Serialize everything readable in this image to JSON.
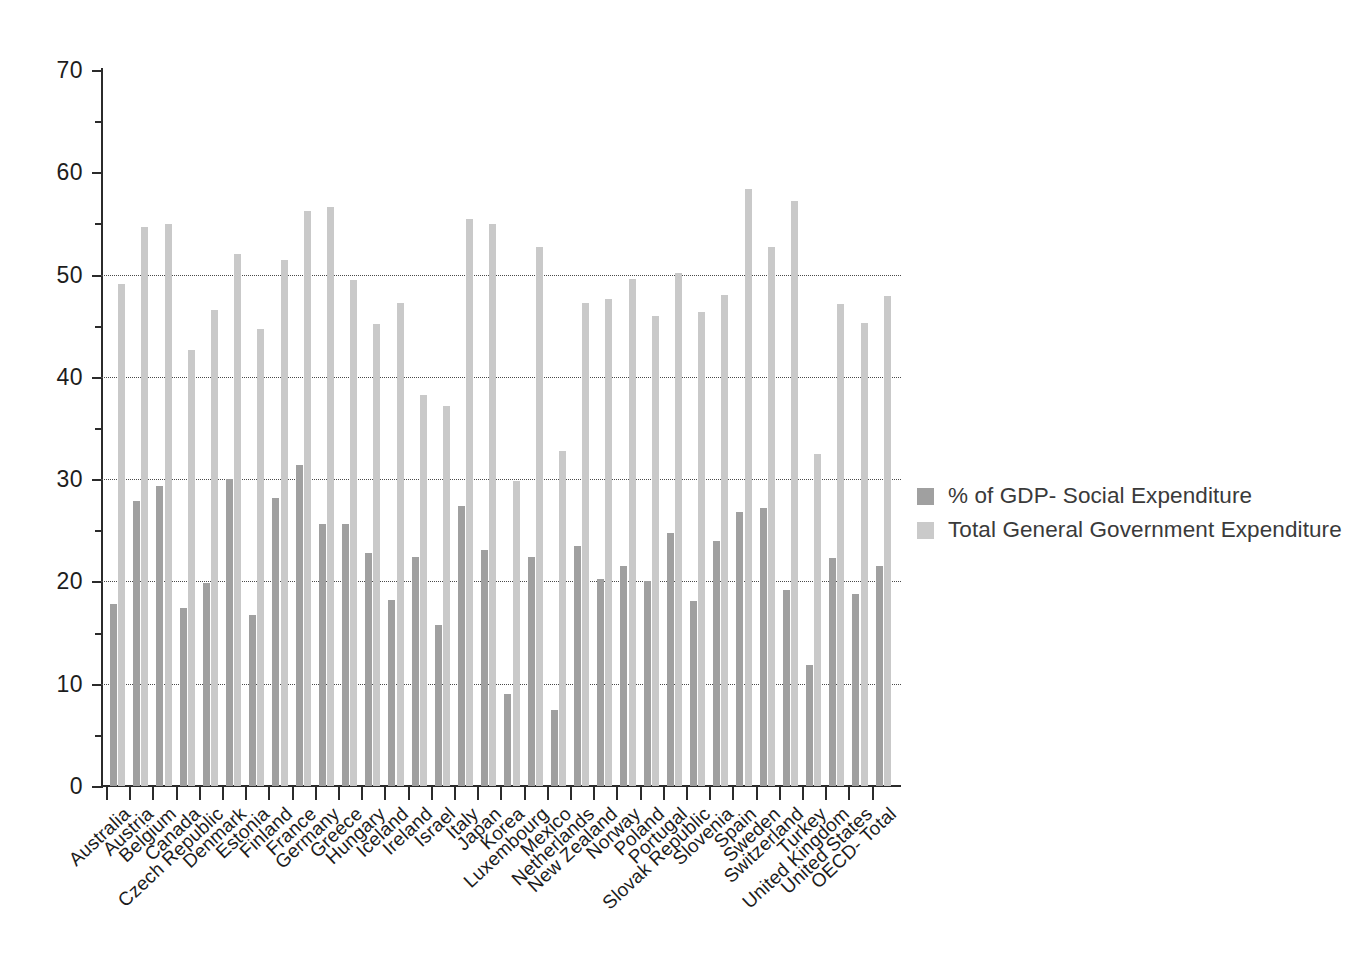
{
  "chart_data": {
    "type": "bar",
    "title": "",
    "subtitle": "",
    "xlabel": "",
    "ylabel": "",
    "ylim": [
      0,
      70
    ],
    "y_ticks": [
      0,
      10,
      20,
      30,
      40,
      50,
      60,
      70
    ],
    "y_tick_labels": [
      "0",
      "10",
      "20",
      "30",
      "40",
      "50",
      "60",
      "70"
    ],
    "y_minor_ticks": [
      5,
      15,
      25,
      35,
      45,
      55,
      65
    ],
    "grid": "horizontal-dotted-at-10-20-30-40-50",
    "grid_values": [
      10,
      20,
      30,
      40,
      50
    ],
    "legend_position": "right",
    "categories": [
      "Australia",
      "Austria",
      "Belgium",
      "Canada",
      "Czech Republic",
      "Denmark",
      "Estonia",
      "Finland",
      "France",
      "Germany",
      "Greece",
      "Hungary",
      "Iceland",
      "Ireland",
      "Israel",
      "Italy",
      "Japan",
      "Korea",
      "Luxembourg",
      "Mexico",
      "Netherlands",
      "New Zealand",
      "Norway",
      "Poland",
      "Portugal",
      "Slovak Republic",
      "Slovenia",
      "Spain",
      "Sweden",
      "Switzerland",
      "Turkey",
      "United Kingdom",
      "United States",
      "OECD- Total"
    ],
    "series": [
      {
        "name": "% of GDP- Social Expenditure",
        "color": "#a0a0a0",
        "values": [
          17.8,
          27.9,
          29.3,
          17.4,
          19.8,
          30.0,
          16.7,
          28.2,
          31.4,
          25.6,
          25.6,
          22.8,
          18.2,
          22.4,
          15.7,
          27.4,
          23.1,
          9.0,
          22.4,
          7.4,
          23.5,
          20.2,
          21.5,
          20.0,
          24.7,
          18.1,
          24.0,
          26.8,
          27.2,
          19.2,
          11.8,
          22.3,
          18.8,
          21.5
        ]
      },
      {
        "name": "Total General Government Expenditure",
        "color": "#c9c9c9",
        "values": [
          49.1,
          54.7,
          54.9,
          42.6,
          46.5,
          52.0,
          44.7,
          51.4,
          56.2,
          56.6,
          49.5,
          45.2,
          47.2,
          38.2,
          37.2,
          55.4,
          54.9,
          29.8,
          52.7,
          32.8,
          47.2,
          47.6,
          49.6,
          46.0,
          50.2,
          46.3,
          48.0,
          58.4,
          52.7,
          57.2,
          32.5,
          47.1,
          45.3,
          47.9
        ]
      }
    ]
  },
  "legend": {
    "items": [
      {
        "label": "% of GDP- Social Expenditure",
        "swatch": "dark"
      },
      {
        "label": "Total General Government Expenditure",
        "swatch": "light"
      }
    ]
  }
}
